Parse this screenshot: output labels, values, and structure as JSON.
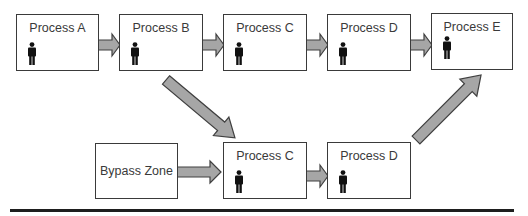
{
  "diagram": {
    "type": "process-flow",
    "top_row": [
      {
        "id": "A",
        "label": "Process A",
        "has_person": true
      },
      {
        "id": "B",
        "label": "Process B",
        "has_person": true
      },
      {
        "id": "C",
        "label": "Process C",
        "has_person": true
      },
      {
        "id": "D",
        "label": "Process D",
        "has_person": true
      },
      {
        "id": "E",
        "label": "Process E",
        "has_person": true
      }
    ],
    "bottom_row": [
      {
        "id": "bypass",
        "label": "Bypass Zone",
        "has_person": false
      },
      {
        "id": "C2",
        "label": "Process C",
        "has_person": true
      },
      {
        "id": "D2",
        "label": "Process D",
        "has_person": true
      }
    ],
    "edges": [
      {
        "from": "A",
        "to": "B"
      },
      {
        "from": "B",
        "to": "C"
      },
      {
        "from": "C",
        "to": "D"
      },
      {
        "from": "D",
        "to": "E"
      },
      {
        "from": "B",
        "to": "C2"
      },
      {
        "from": "bypass",
        "to": "C2"
      },
      {
        "from": "C2",
        "to": "D2"
      },
      {
        "from": "D2",
        "to": "E"
      }
    ],
    "icons": {
      "person": "person-icon",
      "arrow": "block-arrow"
    },
    "colors": {
      "box_border": "#3a3a3a",
      "arrow_fill": "#a6a6a6",
      "arrow_stroke": "#404040",
      "text": "#3a3a3a",
      "baseline": "#1e1e1e"
    }
  }
}
